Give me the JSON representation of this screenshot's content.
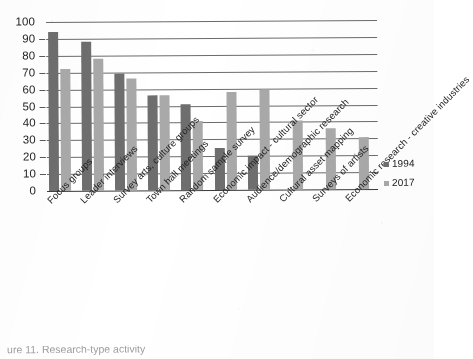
{
  "chart_data": {
    "type": "bar",
    "title": "",
    "xlabel": "",
    "ylabel": "",
    "ylim": [
      0,
      100
    ],
    "ytick_step": 10,
    "ytick_labels": [
      "100",
      "90",
      "80",
      "70",
      "60",
      "50",
      "40",
      "30",
      "20",
      "10",
      "0"
    ],
    "grid": "horizontal",
    "legend_position": "right",
    "orientation": "vertical",
    "grouping": "grouped",
    "categories": [
      "Focus groups",
      "Leader interviews",
      "Survey arts, culture groups",
      "Town hall meetings",
      "Random sample survey",
      "Economic impact - cultural sector",
      "Audience/demographic research",
      "Cultural asset mapping",
      "Surveys of artists",
      "Economic research - creative industries"
    ],
    "series": [
      {
        "name": "1994",
        "color": "#6e6e6e",
        "values": [
          94,
          88,
          69,
          56,
          51,
          25,
          20,
          null,
          null,
          null
        ]
      },
      {
        "name": "2017",
        "color": "#a9a9a9",
        "values": [
          72,
          78,
          66,
          56,
          41,
          58,
          59,
          41,
          36,
          31
        ]
      }
    ]
  },
  "legend": {
    "items": [
      {
        "label": "1994",
        "color": "#6e6e6e"
      },
      {
        "label": "2017",
        "color": "#a9a9a9"
      }
    ]
  },
  "caption": {
    "text": "ure 11. Research-type activity"
  }
}
